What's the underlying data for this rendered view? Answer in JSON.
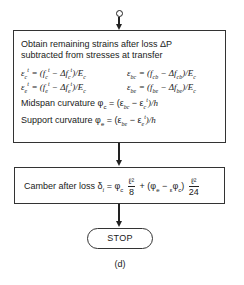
{
  "box1": {
    "intro_line1": "Obtain remaining strains after loss ΔP",
    "intro_line2": "subtracted from stresses at transfer",
    "eq_left_1": {
      "lhs": "ε",
      "lhs_sub": "c",
      "lhs_sup": "t",
      "rhs": "= (f",
      "rhs_sub1": "c",
      "rhs_sup1": "t",
      "mid": " − Δf",
      "rhs_sub2": "c",
      "rhs_sup2": "t",
      "tail": ")/E",
      "tail_sub": "c"
    },
    "eq_left_2": {
      "lhs": "ε",
      "lhs_sub": "e",
      "lhs_sup": "t",
      "rhs": "= (f",
      "rhs_sub1": "e",
      "rhs_sup1": "t",
      "mid": " − Δf",
      "rhs_sub2": "e",
      "rhs_sup2": "t",
      "tail": ")/E",
      "tail_sub": "c"
    },
    "eq_right_1": {
      "lhs": "ε",
      "lhs_sub": "bc",
      "rhs": "= (f",
      "rhs_sub1": "cb",
      "mid": " − Δf",
      "rhs_sub2": "cb",
      "tail": ")/E",
      "tail_sub": "c"
    },
    "eq_right_2": {
      "lhs": "ε",
      "lhs_sub": "be",
      "rhs": "= (f",
      "rhs_sub1": "be",
      "mid": " − Δf",
      "rhs_sub2": "be",
      "tail": ")/E",
      "tail_sub": "c"
    },
    "midspan": {
      "label": "Midspan curvature φ",
      "sub": "c",
      "rhs": " = (ε",
      "rhs_sub": "bc",
      "mid": " − ε",
      "mid_sub": "c",
      "mid_sup": "t",
      "tail": ")/h"
    },
    "support": {
      "label": "Support curvature φ",
      "sub": "e",
      "rhs": " = (ε",
      "rhs_sub": "be",
      "mid": " − ε",
      "mid_sub": "e",
      "mid_sup": "t",
      "tail": ")/h"
    }
  },
  "box2": {
    "label": "Camber after loss δ",
    "label_sub": "i",
    "eq": " = φ",
    "eq_sub": "c",
    "frac1_num": "ℓ²",
    "frac1_den": "8",
    "plus": " + (φ",
    "plus_sub": "e",
    "minus": " − ",
    "minus_pre": "ε",
    "minus_phi": "φ",
    "minus_sub": "c",
    "close": ")",
    "frac2_num": "ℓ²",
    "frac2_den": "24"
  },
  "terminal": {
    "label": "STOP"
  },
  "caption": "(d)"
}
